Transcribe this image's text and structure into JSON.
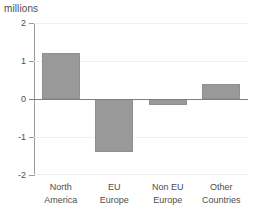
{
  "chart_data": {
    "type": "bar",
    "title": "millions",
    "subtitle": "",
    "xlabel": "",
    "ylabel": "millions",
    "categories": [
      "North America",
      "EU Europe",
      "Non EU Europe",
      "Other Countries"
    ],
    "category_lines": [
      [
        "North",
        "America"
      ],
      [
        "EU",
        "Europe"
      ],
      [
        "Non EU",
        "Europe"
      ],
      [
        "Other",
        "Countries"
      ]
    ],
    "values": [
      1.2,
      -1.4,
      -0.15,
      0.4
    ],
    "ylim": [
      -2,
      2
    ],
    "yticks": [
      2,
      1,
      0,
      -1,
      -2
    ],
    "ytick_labels": [
      "2",
      "1",
      "0",
      "-1",
      "-2"
    ],
    "grid": true,
    "legend": "none",
    "bar_color": "#999999",
    "gridline_color": "#f0f0f0",
    "axis_color": "#9a9a9a",
    "zero_line_color": "#808080",
    "text_color": "#4d4d4d"
  }
}
